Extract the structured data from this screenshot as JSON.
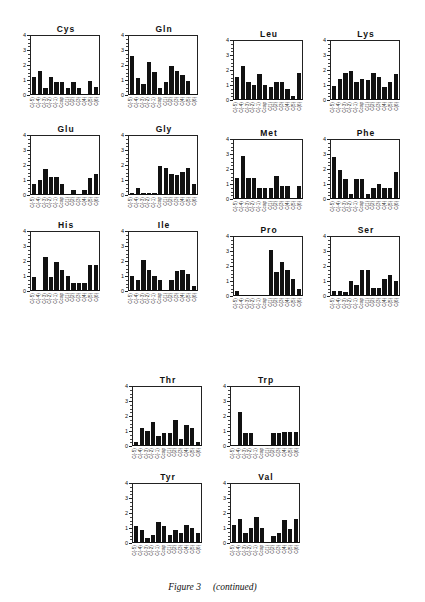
{
  "figure": {
    "caption_main": "Figure 3",
    "caption_sub": "(continued)"
  },
  "chart_data": [
    {
      "type": "bar",
      "title": "Cys",
      "categories": [
        "C(-5)",
        "C(-4)",
        "C(-3)",
        "C(-2)",
        "C(-1)",
        "Ccap",
        "C(1)",
        "C(2)",
        "C(3)",
        "C(4)",
        "C(5)",
        "C(6)"
      ],
      "values": [
        1.2,
        1.6,
        0.4,
        1.2,
        0.8,
        0.8,
        0.4,
        0.8,
        0.4,
        0,
        0.9,
        0.5
      ],
      "ylim": [
        0,
        4
      ],
      "yticks": [
        "0",
        "1",
        "2",
        "3",
        "4"
      ],
      "grid": false
    },
    {
      "type": "bar",
      "title": "Gln",
      "categories": [
        "C(-5)",
        "C(-4)",
        "C(-3)",
        "C(-2)",
        "C(-1)",
        "Ccap",
        "C(1)",
        "C(2)",
        "C(3)",
        "C(4)",
        "C(5)",
        "C(6)"
      ],
      "values": [
        2.6,
        1.1,
        0.7,
        2.2,
        1.5,
        0.4,
        0.8,
        1.9,
        1.6,
        1.3,
        0.9,
        0
      ],
      "ylim": [
        0,
        4
      ],
      "yticks": [
        "0",
        "1",
        "2",
        "3",
        "4"
      ],
      "grid": false
    },
    {
      "type": "bar",
      "title": "Leu",
      "categories": [
        "C(-5)",
        "C(-4)",
        "C(-3)",
        "C(-2)",
        "C(-1)",
        "Ccap",
        "C(1)",
        "C(2)",
        "C(3)",
        "C(4)",
        "C(5)",
        "C(6)"
      ],
      "values": [
        1.5,
        2.3,
        1.2,
        1.0,
        1.7,
        1.0,
        0.8,
        1.2,
        1.2,
        0.7,
        0.2,
        1.8
      ],
      "ylim": [
        0,
        4
      ],
      "yticks": [
        "0",
        "1",
        "2",
        "3",
        "4"
      ],
      "grid": false
    },
    {
      "type": "bar",
      "title": "Lys",
      "categories": [
        "C(-5)",
        "C(-4)",
        "C(-3)",
        "C(-2)",
        "C(-1)",
        "Ccap",
        "C(1)",
        "C(2)",
        "C(3)",
        "C(4)",
        "C(5)",
        "C(6)"
      ],
      "values": [
        0.9,
        1.4,
        1.8,
        1.9,
        1.2,
        1.4,
        1.3,
        1.8,
        1.5,
        0.8,
        1.2,
        1.7
      ],
      "ylim": [
        0,
        4
      ],
      "yticks": [
        "0",
        "1",
        "2",
        "3",
        "4"
      ],
      "grid": false
    },
    {
      "type": "bar",
      "title": "Glu",
      "categories": [
        "C(-5)",
        "C(-4)",
        "C(-3)",
        "C(-2)",
        "C(-1)",
        "Ccap",
        "C(1)",
        "C(2)",
        "C(3)",
        "C(4)",
        "C(5)",
        "C(6)"
      ],
      "values": [
        0.7,
        1.0,
        1.7,
        1.2,
        1.2,
        0.7,
        0,
        0.3,
        0,
        0.3,
        1.1,
        1.4
      ],
      "ylim": [
        0,
        4
      ],
      "yticks": [
        "0",
        "1",
        "2",
        "3",
        "4"
      ],
      "grid": false
    },
    {
      "type": "bar",
      "title": "Gly",
      "categories": [
        "C(-5)",
        "C(-4)",
        "C(-3)",
        "C(-2)",
        "C(-1)",
        "Ccap",
        "C(1)",
        "C(2)",
        "C(3)",
        "C(4)",
        "C(5)",
        "C(6)"
      ],
      "values": [
        0.1,
        0.4,
        0.1,
        0.1,
        0.1,
        1.9,
        1.8,
        1.4,
        1.3,
        1.5,
        1.8,
        0.7
      ],
      "ylim": [
        0,
        4
      ],
      "yticks": [
        "0",
        "1",
        "2",
        "3",
        "4"
      ],
      "grid": false
    },
    {
      "type": "bar",
      "title": "Met",
      "categories": [
        "C(-5)",
        "C(-4)",
        "C(-3)",
        "C(-2)",
        "C(-1)",
        "Ccap",
        "C(1)",
        "C(2)",
        "C(3)",
        "C(4)",
        "C(5)",
        "C(6)"
      ],
      "values": [
        1.4,
        2.9,
        1.4,
        1.4,
        0.7,
        0.7,
        0.7,
        1.5,
        0.8,
        0.8,
        0,
        0.8
      ],
      "ylim": [
        0,
        4
      ],
      "yticks": [
        "0",
        "1",
        "2",
        "3",
        "4"
      ],
      "grid": false
    },
    {
      "type": "bar",
      "title": "Phe",
      "categories": [
        "C(-5)",
        "C(-4)",
        "C(-3)",
        "C(-2)",
        "C(-1)",
        "Ccap",
        "C(1)",
        "C(2)",
        "C(3)",
        "C(4)",
        "C(5)",
        "C(6)"
      ],
      "values": [
        2.8,
        1.9,
        1.3,
        0.3,
        1.3,
        1.3,
        0.3,
        0.7,
        1.0,
        0.7,
        0.7,
        1.8
      ],
      "ylim": [
        0,
        4
      ],
      "yticks": [
        "0",
        "1",
        "2",
        "3",
        "4"
      ],
      "grid": false
    },
    {
      "type": "bar",
      "title": "His",
      "categories": [
        "C(-5)",
        "C(-4)",
        "C(-3)",
        "C(-2)",
        "C(-1)",
        "Ccap",
        "C(1)",
        "C(2)",
        "C(3)",
        "C(4)",
        "C(5)",
        "C(6)"
      ],
      "values": [
        0.9,
        0,
        2.3,
        0.9,
        1.9,
        1.4,
        1.0,
        0.5,
        0.5,
        0.5,
        1.7,
        1.7
      ],
      "ylim": [
        0,
        4
      ],
      "yticks": [
        "0",
        "1",
        "2",
        "3",
        "4"
      ],
      "grid": false
    },
    {
      "type": "bar",
      "title": "Ile",
      "categories": [
        "C(-5)",
        "C(-4)",
        "C(-3)",
        "C(-2)",
        "C(-1)",
        "Ccap",
        "C(1)",
        "C(2)",
        "C(3)",
        "C(4)",
        "C(5)",
        "C(6)"
      ],
      "values": [
        1.0,
        0.7,
        2.1,
        1.4,
        1.0,
        0.7,
        0,
        0.7,
        1.3,
        1.4,
        1.1,
        0.3
      ],
      "ylim": [
        0,
        4
      ],
      "yticks": [
        "0",
        "1",
        "2",
        "3",
        "4"
      ],
      "grid": false
    },
    {
      "type": "bar",
      "title": "Pro",
      "categories": [
        "C(-5)",
        "C(-4)",
        "C(-3)",
        "C(-2)",
        "C(-1)",
        "Ccap",
        "C(1)",
        "C(2)",
        "C(3)",
        "C(4)",
        "C(5)",
        "C(6)"
      ],
      "values": [
        0.3,
        0,
        0,
        0,
        0,
        0,
        3.1,
        1.6,
        2.3,
        1.7,
        1.1,
        0.4
      ],
      "ylim": [
        0,
        4
      ],
      "yticks": [
        "0",
        "1",
        "2",
        "3",
        "4"
      ],
      "grid": false
    },
    {
      "type": "bar",
      "title": "Ser",
      "categories": [
        "C(-5)",
        "C(-4)",
        "C(-3)",
        "C(-2)",
        "C(-1)",
        "Ccap",
        "C(1)",
        "C(2)",
        "C(3)",
        "C(4)",
        "C(5)",
        "C(6)"
      ],
      "values": [
        0.3,
        0.3,
        0.2,
        1.0,
        0.7,
        1.7,
        1.7,
        0.5,
        0.5,
        1.1,
        1.4,
        1.0
      ],
      "ylim": [
        0,
        4
      ],
      "yticks": [
        "0",
        "1",
        "2",
        "3",
        "4"
      ],
      "grid": false
    },
    {
      "type": "bar",
      "title": "Thr",
      "categories": [
        "C(-5)",
        "C(-4)",
        "C(-3)",
        "C(-2)",
        "C(-1)",
        "Ccap",
        "C(1)",
        "C(2)",
        "C(3)",
        "C(4)",
        "C(5)",
        "C(6)"
      ],
      "values": [
        0.2,
        1.2,
        1.0,
        1.6,
        0.6,
        0.8,
        0.8,
        1.7,
        0.4,
        1.4,
        1.2,
        0.2
      ],
      "ylim": [
        0,
        4
      ],
      "yticks": [
        "0",
        "1",
        "2",
        "3",
        "4"
      ],
      "grid": false
    },
    {
      "type": "bar",
      "title": "Trp",
      "categories": [
        "C(-5)",
        "C(-4)",
        "C(-3)",
        "C(-2)",
        "C(-1)",
        "Ccap",
        "C(1)",
        "C(2)",
        "C(3)",
        "C(4)",
        "C(5)",
        "C(6)"
      ],
      "values": [
        0,
        2.3,
        0.8,
        0.8,
        0,
        0,
        0,
        0.8,
        0.8,
        0.9,
        0.9,
        0.9
      ],
      "ylim": [
        0,
        4
      ],
      "yticks": [
        "0",
        "1",
        "2",
        "3",
        "4"
      ],
      "grid": false
    },
    {
      "type": "bar",
      "title": "Tyr",
      "categories": [
        "C(-5)",
        "C(-4)",
        "C(-3)",
        "C(-2)",
        "C(-1)",
        "Ccap",
        "C(1)",
        "C(2)",
        "C(3)",
        "C(4)",
        "C(5)",
        "C(6)"
      ],
      "values": [
        1.1,
        0.8,
        0.3,
        0.5,
        1.4,
        1.1,
        0.5,
        0.8,
        0.6,
        1.2,
        1.0,
        0.6
      ],
      "ylim": [
        0,
        4
      ],
      "yticks": [
        "0",
        "1",
        "2",
        "3",
        "4"
      ],
      "grid": false
    },
    {
      "type": "bar",
      "title": "Val",
      "categories": [
        "C(-5)",
        "C(-4)",
        "C(-3)",
        "C(-2)",
        "C(-1)",
        "Ccap",
        "C(1)",
        "C(2)",
        "C(3)",
        "C(4)",
        "C(5)",
        "C(6)"
      ],
      "values": [
        1.2,
        1.6,
        0.6,
        1.0,
        1.7,
        1.0,
        0,
        0.4,
        0.6,
        1.5,
        0.9,
        1.6
      ],
      "ylim": [
        0,
        4
      ],
      "yticks": [
        "0",
        "1",
        "2",
        "3",
        "4"
      ],
      "grid": false
    }
  ],
  "layout": {
    "positions": [
      [
        8,
        24
      ],
      [
        106,
        24
      ],
      [
        211,
        29
      ],
      [
        308,
        29
      ],
      [
        8,
        124
      ],
      [
        106,
        124
      ],
      [
        211,
        128
      ],
      [
        308,
        128
      ],
      [
        8,
        220
      ],
      [
        106,
        220
      ],
      [
        211,
        225
      ],
      [
        308,
        225
      ],
      [
        110,
        375
      ],
      [
        208,
        375
      ],
      [
        110,
        472
      ],
      [
        208,
        472
      ]
    ]
  }
}
